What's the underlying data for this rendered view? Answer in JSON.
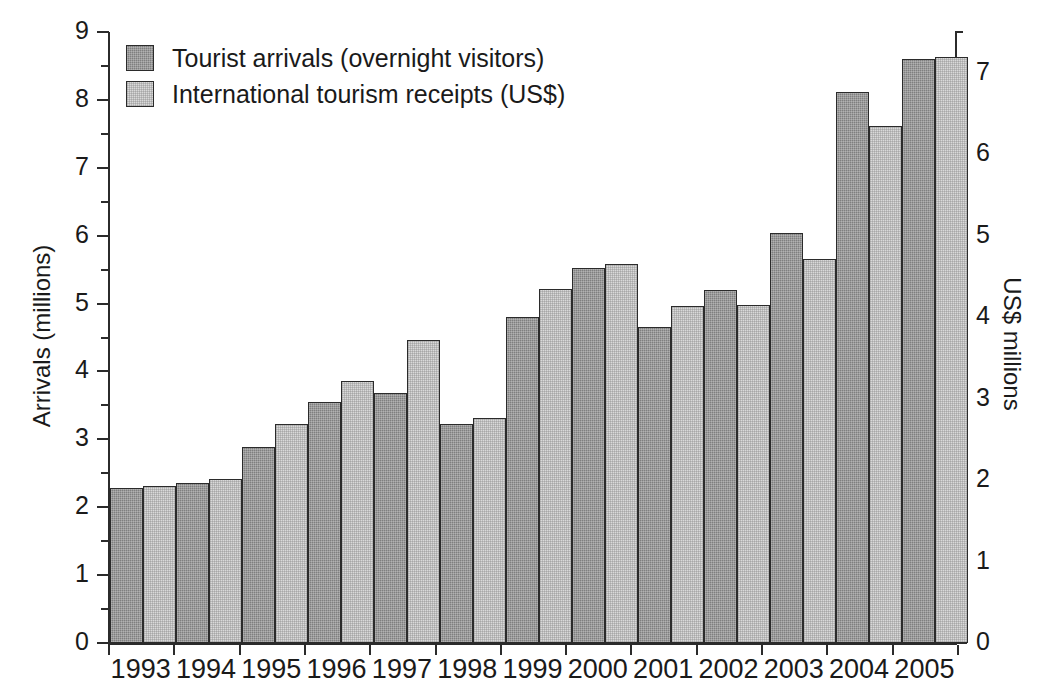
{
  "chart_data": {
    "type": "bar",
    "title": "",
    "subtitle": "",
    "categories": [
      "1993",
      "1994",
      "1995",
      "1996",
      "1997",
      "1998",
      "1999",
      "2000",
      "2001",
      "2002",
      "2003",
      "2004",
      "2005"
    ],
    "series": [
      {
        "name": "Tourist arrivals (overnight visitors)",
        "axis": "left",
        "units": "millions",
        "color": "#7f7f7f",
        "values": [
          2.28,
          2.35,
          2.88,
          3.55,
          3.69,
          3.22,
          4.8,
          5.52,
          4.65,
          5.2,
          6.04,
          8.11,
          8.6
        ]
      },
      {
        "name": "International tourism receipts (US$)",
        "axis": "right",
        "units": "US$ millions",
        "color": "#d9d9d9",
        "values_left_scale": [
          2.32,
          2.42,
          3.22,
          3.86,
          4.47,
          3.31,
          5.22,
          5.58,
          4.96,
          4.98,
          5.66,
          7.61,
          8.63
        ],
        "values": [
          1.93,
          2.02,
          2.68,
          3.22,
          3.73,
          2.76,
          4.35,
          4.65,
          4.13,
          4.15,
          4.72,
          6.34,
          7.19
        ]
      }
    ],
    "xlabel": "",
    "ylabel": "Arrivals (millions)",
    "ylabel_right": "US$ millions",
    "ylim": [
      0,
      9
    ],
    "ylim_right": [
      0,
      7.5
    ],
    "ytick_step": 1,
    "yminor_step": 0.5,
    "grid": false,
    "legend_position": "top-left"
  },
  "axes": {
    "left": {
      "title": "Arrivals (millions)",
      "ticks": [
        "0",
        "1",
        "2",
        "3",
        "4",
        "5",
        "6",
        "7",
        "8",
        "9"
      ]
    },
    "right": {
      "title": "US$ millions",
      "ticks": [
        "0",
        "1",
        "2",
        "3",
        "4",
        "5",
        "6",
        "7"
      ]
    },
    "x": {
      "labels": [
        "1993",
        "1994",
        "1995",
        "1996",
        "1997",
        "1998",
        "1999",
        "2000",
        "2001",
        "2002",
        "2003",
        "2004",
        "2005"
      ]
    }
  },
  "legend": {
    "items": [
      {
        "label": "Tourist arrivals (overnight visitors)",
        "swatch": "arrivals-swatch"
      },
      {
        "label": "International tourism receipts (US$)",
        "swatch": "receipts-swatch"
      }
    ]
  }
}
